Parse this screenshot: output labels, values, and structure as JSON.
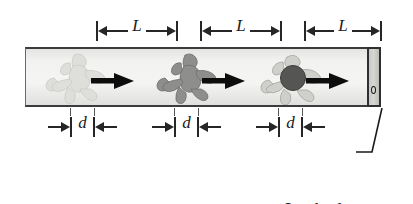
{
  "figure": {
    "background_color": "#ffffff"
  },
  "corridor": {
    "name": "corridor-tube",
    "fill_color": "#f2f2f0",
    "edge_color": "#3b3b3b"
  },
  "door": {
    "name": "locked-door",
    "fill_color": "#d6d6d3",
    "edge_color": "#2f2f2f",
    "knob": "o"
  },
  "runners": [
    {
      "id": "runner-1",
      "shade": "#ddddda",
      "tone": "faint",
      "arrow_color": "#0d0d0d"
    },
    {
      "id": "runner-2",
      "shade": "#8e8e8c",
      "tone": "medium",
      "arrow_color": "#0d0d0d"
    },
    {
      "id": "runner-3",
      "shade": "#c9c9c6",
      "tone": "light-with-dark-head",
      "arrow_color": "#0d0d0d"
    }
  ],
  "dimensions": {
    "length_markers": [
      {
        "label": "L"
      },
      {
        "label": "L"
      },
      {
        "label": "L"
      }
    ],
    "offset_markers": [
      {
        "label": "d"
      },
      {
        "label": "d"
      },
      {
        "label": "d"
      }
    ]
  },
  "callout": {
    "line1": "Locked",
    "line2": "door"
  }
}
